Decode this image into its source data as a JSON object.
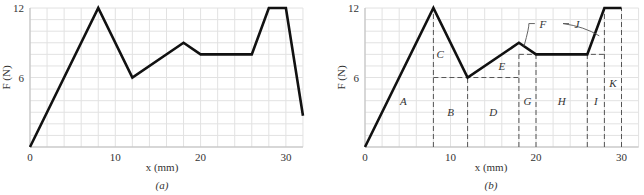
{
  "chart_data": [
    {
      "type": "line",
      "panel": "a",
      "subtitle": "(a)",
      "xlabel": "x (mm)",
      "ylabel": "F (N)",
      "xlim": [
        0,
        32
      ],
      "ylim": [
        0,
        12
      ],
      "xticks": [
        0,
        10,
        20,
        30
      ],
      "yticks": [
        0,
        6,
        12
      ],
      "grid": true,
      "grid_minor": {
        "x_step": 2,
        "y_step": 1
      },
      "series": [
        {
          "name": "F(x)",
          "x": [
            0,
            8,
            12,
            18,
            20,
            26,
            28,
            30,
            32
          ],
          "y": [
            0,
            12,
            6,
            9,
            8,
            8,
            12,
            12,
            2.7
          ]
        }
      ]
    },
    {
      "type": "line",
      "panel": "b",
      "subtitle": "(b)",
      "xlabel": "x (mm)",
      "ylabel": "F (N)",
      "xlim": [
        0,
        32
      ],
      "ylim": [
        0,
        12
      ],
      "xticks": [
        0,
        10,
        20,
        30
      ],
      "yticks": [
        0,
        6,
        12
      ],
      "grid": true,
      "grid_minor": {
        "x_step": 2,
        "y_step": 1
      },
      "series": [
        {
          "name": "F(x)",
          "x": [
            0,
            8,
            12,
            18,
            20,
            26,
            28,
            30
          ],
          "y": [
            0,
            12,
            6,
            9,
            8,
            8,
            12,
            12
          ]
        }
      ],
      "dashed_lines": [
        {
          "x1": 8,
          "y1": 0,
          "x2": 8,
          "y2": 12
        },
        {
          "x1": 12,
          "y1": 0,
          "x2": 12,
          "y2": 6
        },
        {
          "x1": 8,
          "y1": 6,
          "x2": 18,
          "y2": 6
        },
        {
          "x1": 18,
          "y1": 0,
          "x2": 18,
          "y2": 8
        },
        {
          "x1": 18,
          "y1": 8,
          "x2": 28,
          "y2": 8
        },
        {
          "x1": 20,
          "y1": 0,
          "x2": 20,
          "y2": 8
        },
        {
          "x1": 26,
          "y1": 0,
          "x2": 26,
          "y2": 8
        },
        {
          "x1": 28,
          "y1": 0,
          "x2": 28,
          "y2": 12
        },
        {
          "x1": 30,
          "y1": 0,
          "x2": 30,
          "y2": 12
        }
      ],
      "region_labels": [
        {
          "text": "A",
          "x": 4.5,
          "y": 4
        },
        {
          "text": "B",
          "x": 10,
          "y": 3
        },
        {
          "text": "C",
          "x": 8.8,
          "y": 8
        },
        {
          "text": "D",
          "x": 15,
          "y": 3
        },
        {
          "text": "E",
          "x": 16,
          "y": 7
        },
        {
          "text": "G",
          "x": 19,
          "y": 4
        },
        {
          "text": "H",
          "x": 23,
          "y": 4
        },
        {
          "text": "I",
          "x": 27,
          "y": 4
        },
        {
          "text": "K",
          "x": 29,
          "y": 5.5
        }
      ],
      "callouts": [
        {
          "text": "F",
          "label_x": 20.8,
          "label_y": 10.4,
          "target_x": 18.6,
          "target_y": 8.7
        },
        {
          "text": "J",
          "label_x": 24.8,
          "label_y": 10.4,
          "target_x": 27.4,
          "target_y": 9.6
        }
      ]
    }
  ]
}
